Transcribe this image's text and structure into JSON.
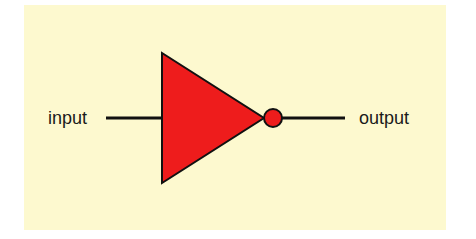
{
  "diagram": {
    "type": "logic-gate",
    "gate": "NOT (inverter)",
    "labels": {
      "input": "input",
      "output": "output"
    },
    "colors": {
      "background": "#fdf9cf",
      "gate_fill": "#ee1c1c",
      "stroke": "#111111"
    }
  }
}
